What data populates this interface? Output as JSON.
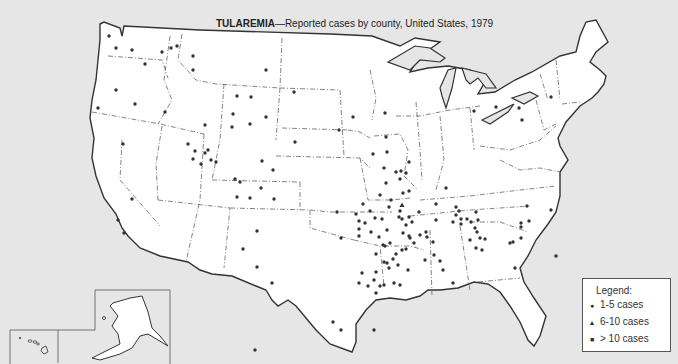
{
  "title": {
    "bold": "TULAREMIA",
    "rest": "—Reported cases by county, United States, 1979"
  },
  "legend": {
    "title": "Legend:",
    "items": [
      {
        "symbol": "circle",
        "glyph": "●",
        "label": "1-5 cases"
      },
      {
        "symbol": "triangle",
        "glyph": "▲",
        "label": "6-10 cases"
      },
      {
        "symbol": "square",
        "glyph": "■",
        "label": "> 10 cases"
      }
    ]
  },
  "insets": [
    "Alaska",
    "Hawaii"
  ],
  "colors": {
    "background": "#e6e6e6",
    "land": "#ffffff",
    "border": "#333333",
    "dot": "#333333"
  },
  "dots_1_5": [
    [
      109,
      36
    ],
    [
      116,
      48
    ],
    [
      132,
      50
    ],
    [
      162,
      52
    ],
    [
      171,
      48
    ],
    [
      177,
      46
    ],
    [
      193,
      56
    ],
    [
      193,
      70
    ],
    [
      266,
      70
    ],
    [
      145,
      64
    ],
    [
      116,
      90
    ],
    [
      135,
      104
    ],
    [
      98,
      108
    ],
    [
      165,
      112
    ],
    [
      205,
      125
    ],
    [
      237,
      96
    ],
    [
      251,
      97
    ],
    [
      233,
      114
    ],
    [
      266,
      117
    ],
    [
      232,
      127
    ],
    [
      294,
      92
    ],
    [
      250,
      124
    ],
    [
      295,
      142
    ],
    [
      353,
      117
    ],
    [
      373,
      154
    ],
    [
      123,
      144
    ],
    [
      188,
      144
    ],
    [
      193,
      159
    ],
    [
      211,
      160
    ],
    [
      201,
      164
    ],
    [
      195,
      151
    ],
    [
      208,
      150
    ],
    [
      205,
      153
    ],
    [
      216,
      162
    ],
    [
      262,
      161
    ],
    [
      273,
      170
    ],
    [
      261,
      188
    ],
    [
      235,
      179
    ],
    [
      240,
      182
    ],
    [
      250,
      198
    ],
    [
      237,
      197
    ],
    [
      274,
      199
    ],
    [
      257,
      231
    ],
    [
      243,
      249
    ],
    [
      257,
      267
    ],
    [
      132,
      199
    ],
    [
      118,
      220
    ],
    [
      124,
      233
    ],
    [
      339,
      130
    ],
    [
      385,
      113
    ],
    [
      386,
      137
    ],
    [
      387,
      152
    ],
    [
      391,
      200
    ],
    [
      389,
      207
    ],
    [
      400,
      211
    ],
    [
      419,
      212
    ],
    [
      436,
      204
    ],
    [
      446,
      188
    ],
    [
      474,
      111
    ],
    [
      496,
      107
    ],
    [
      551,
      97
    ],
    [
      522,
      120
    ],
    [
      519,
      108
    ],
    [
      384,
      168
    ],
    [
      396,
      172
    ],
    [
      401,
      171
    ],
    [
      409,
      162
    ],
    [
      406,
      173
    ],
    [
      386,
      183
    ],
    [
      400,
      179
    ],
    [
      380,
      195
    ],
    [
      403,
      193
    ],
    [
      409,
      191
    ],
    [
      363,
      204
    ],
    [
      365,
      223
    ],
    [
      337,
      212
    ],
    [
      341,
      238
    ],
    [
      356,
      214
    ],
    [
      359,
      221
    ],
    [
      359,
      229
    ],
    [
      359,
      236
    ],
    [
      370,
      211
    ],
    [
      375,
      218
    ],
    [
      382,
      219
    ],
    [
      387,
      230
    ],
    [
      371,
      232
    ],
    [
      379,
      237
    ],
    [
      383,
      245
    ],
    [
      390,
      243
    ],
    [
      399,
      217
    ],
    [
      402,
      219
    ],
    [
      409,
      217
    ],
    [
      406,
      225
    ],
    [
      412,
      222
    ],
    [
      409,
      236
    ],
    [
      403,
      233
    ],
    [
      410,
      238
    ],
    [
      402,
      250
    ],
    [
      396,
      254
    ],
    [
      393,
      259
    ],
    [
      398,
      265
    ],
    [
      389,
      268
    ],
    [
      387,
      263
    ],
    [
      385,
      246
    ],
    [
      376,
      254
    ],
    [
      384,
      262
    ],
    [
      376,
      272
    ],
    [
      362,
      273
    ],
    [
      374,
      280
    ],
    [
      380,
      286
    ],
    [
      359,
      283
    ],
    [
      368,
      286
    ],
    [
      406,
      249
    ],
    [
      414,
      243
    ],
    [
      420,
      235
    ],
    [
      426,
      232
    ],
    [
      427,
      237
    ],
    [
      433,
      242
    ],
    [
      434,
      255
    ],
    [
      425,
      260
    ],
    [
      440,
      261
    ],
    [
      443,
      270
    ],
    [
      453,
      283
    ],
    [
      453,
      222
    ],
    [
      461,
      224
    ],
    [
      456,
      215
    ],
    [
      459,
      211
    ],
    [
      461,
      219
    ],
    [
      467,
      219
    ],
    [
      456,
      207
    ],
    [
      436,
      220
    ],
    [
      470,
      240
    ],
    [
      471,
      222
    ],
    [
      475,
      228
    ],
    [
      477,
      232
    ],
    [
      478,
      220
    ],
    [
      476,
      248
    ],
    [
      480,
      238
    ],
    [
      485,
      239
    ],
    [
      482,
      250
    ],
    [
      510,
      243
    ],
    [
      513,
      242
    ],
    [
      521,
      238
    ],
    [
      521,
      227
    ],
    [
      551,
      210
    ],
    [
      521,
      223
    ],
    [
      529,
      221
    ],
    [
      515,
      268
    ],
    [
      556,
      256
    ],
    [
      408,
      270
    ],
    [
      394,
      283
    ],
    [
      400,
      285
    ],
    [
      384,
      285
    ],
    [
      376,
      293
    ],
    [
      333,
      322
    ],
    [
      272,
      283
    ],
    [
      255,
      350
    ],
    [
      341,
      330
    ],
    [
      374,
      330
    ],
    [
      476,
      212
    ],
    [
      527,
      206
    ]
  ],
  "dots_6_10": [
    [
      402,
      205
    ]
  ],
  "dots_over_10": []
}
